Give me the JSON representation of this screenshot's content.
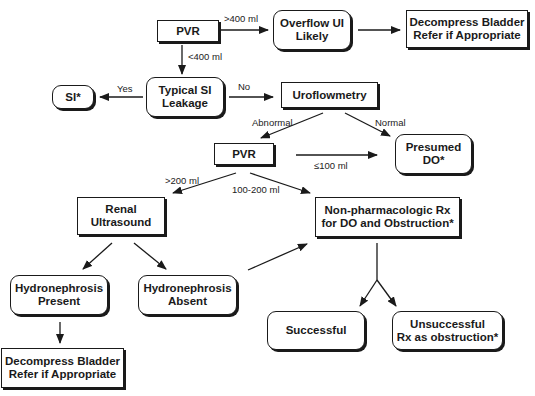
{
  "nodes": {
    "pvr1": "PVR",
    "overflow": "Overflow UI\nLikely",
    "decompress1": "Decompress Bladder\nRefer if Appropriate",
    "si": "SI*",
    "typical_si": "Typical SI\nLeakage",
    "uroflowmetry": "Uroflowmetry",
    "pvr2": "PVR",
    "presumed_do": "Presumed\nDO*",
    "renal_us": "Renal\nUltrasound",
    "nonpharm": "Non-pharmacologic Rx\nfor DO and Obstruction*",
    "hydro_present": "Hydronephrosis\nPresent",
    "hydro_absent": "Hydronephrosis\nAbsent",
    "successful": "Successful",
    "unsuccessful": "Unsuccessful\nRx as obstruction*",
    "decompress2": "Decompress Bladder\nRefer if Appropriate"
  },
  "edge_labels": {
    "gt400": ">400 ml",
    "lt400": "<400 ml",
    "yes": "Yes",
    "no": "No",
    "abnormal": "Abnormal",
    "normal": "Normal",
    "le100": "≤100 ml",
    "gt200": ">200 ml",
    "r100_200": "100-200 ml"
  }
}
